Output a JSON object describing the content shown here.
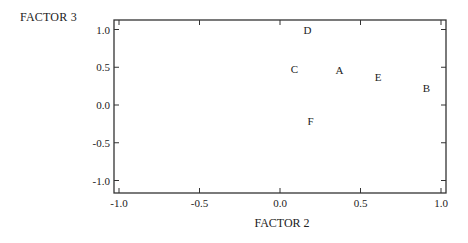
{
  "chart_data": {
    "type": "scatter",
    "title": "",
    "xlabel": "FACTOR 2",
    "ylabel": "FACTOR 3",
    "xlim": [
      -1.05,
      1.03
    ],
    "ylim": [
      -1.17,
      1.13
    ],
    "xticks": [
      -1.0,
      -0.5,
      0.0,
      0.5,
      1.0
    ],
    "yticks": [
      1.0,
      0.5,
      0.0,
      -0.5,
      -1.0
    ],
    "xtick_labels": [
      "-1.0",
      "-0.5",
      "0.0",
      "0.5",
      "1.0"
    ],
    "ytick_labels": [
      "1.0",
      "0.5",
      "0.0",
      "-0.5",
      "-1.0"
    ],
    "grid": false,
    "legend": null,
    "points": [
      {
        "label": "D",
        "x": 0.17,
        "y": 0.99
      },
      {
        "label": "C",
        "x": 0.09,
        "y": 0.48
      },
      {
        "label": "A",
        "x": 0.37,
        "y": 0.46
      },
      {
        "label": "E",
        "x": 0.61,
        "y": 0.37
      },
      {
        "label": "B",
        "x": 0.91,
        "y": 0.23
      },
      {
        "label": "F",
        "x": 0.19,
        "y": -0.21
      }
    ]
  }
}
